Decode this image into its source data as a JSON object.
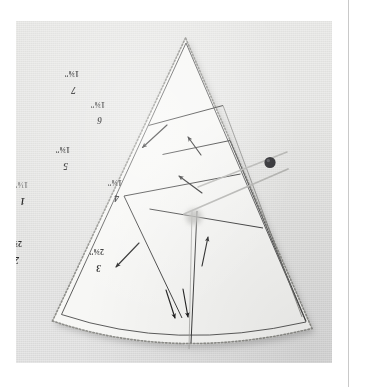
{
  "scene": {
    "kind": "photograph",
    "subject": "paper-pieced foundation pattern, cone / fan wedge shape",
    "background_color": "#e3e3e1",
    "paper_color": "#f7f7f5",
    "ink_color": "#2a2a2a",
    "page_rule_color": "#c9c9c9"
  },
  "pattern": {
    "title": "cone-wedge-foundation-pattern",
    "orientation_note": "all printed text appears upside-down (rotated 180 degrees)",
    "edge_style": "pinked / dotted seam-allowance edge",
    "sections": [
      {
        "id": "1",
        "number": "1",
        "measurement": "1⅛\"",
        "obscured": true
      },
      {
        "id": "2",
        "number": "2",
        "measurement": "2⅜\"",
        "obscured": false
      },
      {
        "id": "3",
        "number": "3",
        "measurement": "2⅜\"",
        "obscured": false
      },
      {
        "id": "4",
        "number": "4",
        "measurement": "1⅜\"",
        "obscured": false
      },
      {
        "id": "5",
        "number": "5",
        "measurement": "1⅜\"",
        "obscured": false
      },
      {
        "id": "6",
        "number": "6",
        "measurement": "1⅜\"",
        "obscured": false
      },
      {
        "id": "7",
        "number": "7",
        "measurement": "1⅜\"",
        "obscured": false
      }
    ],
    "arrows": [
      {
        "id": "arrow-upper-left",
        "direction": "down-left"
      },
      {
        "id": "arrow-mid-left",
        "direction": "down-left"
      },
      {
        "id": "arrow-center-up",
        "direction": "up-left"
      },
      {
        "id": "arrow-right-up",
        "direction": "up"
      },
      {
        "id": "arrow-center-right-up",
        "direction": "up-right"
      },
      {
        "id": "arrow-bottom-a",
        "direction": "down"
      },
      {
        "id": "arrow-bottom-b",
        "direction": "down"
      }
    ]
  },
  "pin": {
    "head_label": "pin-head",
    "head_color": "#2f2f33",
    "shaft_color": "#b4b4b2",
    "shaft_count": 2
  }
}
